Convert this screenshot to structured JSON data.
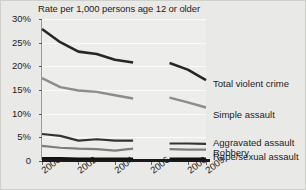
{
  "chart_data": {
    "type": "line",
    "title": "Rate per 1,000 persons age 12 or older",
    "xlabel": "",
    "ylabel": "",
    "ylim": [
      0,
      30
    ],
    "xlim": [
      2000,
      2009
    ],
    "grid": true,
    "legend_position": "right",
    "ytick_labels": [
      "30%",
      "25%",
      "20%",
      "15%",
      "10%",
      "5%",
      "0"
    ],
    "ytick_values": [
      30,
      25,
      20,
      15,
      10,
      5,
      0
    ],
    "xtick_labels": [
      "2000",
      "2002",
      "2004",
      "2006",
      "2008",
      "2009"
    ],
    "xtick_values": [
      2000,
      2002,
      2004,
      2006,
      2008,
      2009
    ],
    "note": "Series are broken between 2005 and 2007",
    "series": [
      {
        "name": "Total violent crime",
        "color": "#262626",
        "x": [
          2000,
          2001,
          2002,
          2003,
          2004,
          2005,
          2007,
          2008,
          2009
        ],
        "values": [
          27.9,
          25.1,
          23.1,
          22.6,
          21.4,
          20.8,
          20.7,
          19.3,
          17.1
        ]
      },
      {
        "name": "Simple assault",
        "color": "#8c8c8c",
        "x": [
          2000,
          2001,
          2002,
          2003,
          2004,
          2005,
          2007,
          2008,
          2009
        ],
        "values": [
          17.5,
          15.6,
          14.9,
          14.6,
          13.9,
          13.2,
          13.4,
          12.4,
          11.3
        ]
      },
      {
        "name": "Aggravated assault",
        "color": "#333333",
        "x": [
          2000,
          2001,
          2002,
          2003,
          2004,
          2005,
          2007,
          2008,
          2009
        ],
        "values": [
          5.7,
          5.3,
          4.3,
          4.6,
          4.3,
          4.3,
          3.7,
          3.7,
          3.6
        ]
      },
      {
        "name": "Robbery",
        "color": "#7d7d7d",
        "x": [
          2000,
          2001,
          2002,
          2003,
          2004,
          2005,
          2007,
          2008,
          2009
        ],
        "values": [
          3.2,
          2.8,
          2.6,
          2.5,
          2.2,
          2.6,
          2.5,
          2.4,
          2.4
        ]
      },
      {
        "name": "Rape/sexual assault",
        "color": "#111111",
        "x": [
          2000,
          2001,
          2002,
          2003,
          2004,
          2005,
          2007,
          2008,
          2009
        ],
        "values": [
          0.6,
          0.6,
          0.5,
          0.5,
          0.5,
          0.5,
          0.5,
          0.5,
          0.5
        ]
      }
    ]
  },
  "legend": {
    "items": [
      {
        "label": "Total violent crime"
      },
      {
        "label": "Simple assault"
      },
      {
        "label": "Aggravated assault"
      },
      {
        "label": "Robbery"
      },
      {
        "label": "Rape/sexual assault"
      }
    ]
  }
}
